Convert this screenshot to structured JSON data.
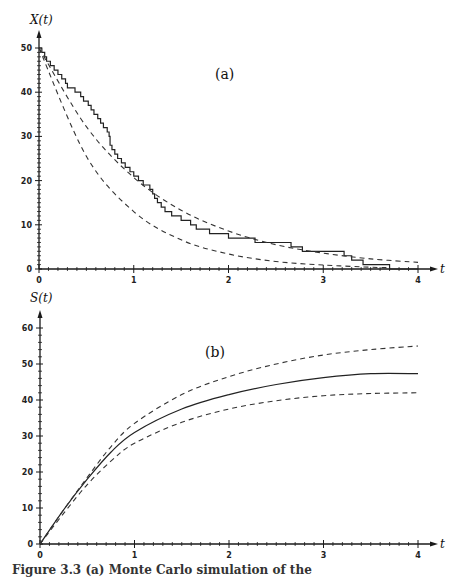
{
  "chart_data": [
    {
      "type": "line",
      "panel_label": "(a)",
      "ylabel": "X(t)",
      "xlabel": "t",
      "xlim": [
        0,
        4
      ],
      "ylim": [
        0,
        50
      ],
      "xticks": [
        "0",
        "1",
        "2",
        "3",
        "4"
      ],
      "yticks": [
        "0",
        "10",
        "20",
        "30",
        "40",
        "50"
      ],
      "grid": false,
      "series": [
        {
          "name": "simulated path (step)",
          "style": "solid-step",
          "points": [
            [
              0,
              50
            ],
            [
              0.03,
              49
            ],
            [
              0.06,
              48
            ],
            [
              0.08,
              47
            ],
            [
              0.12,
              46
            ],
            [
              0.16,
              45
            ],
            [
              0.2,
              44
            ],
            [
              0.24,
              43
            ],
            [
              0.28,
              42
            ],
            [
              0.3,
              41
            ],
            [
              0.38,
              40
            ],
            [
              0.44,
              39
            ],
            [
              0.47,
              38
            ],
            [
              0.52,
              37
            ],
            [
              0.55,
              36
            ],
            [
              0.58,
              35
            ],
            [
              0.62,
              34
            ],
            [
              0.65,
              33
            ],
            [
              0.68,
              32
            ],
            [
              0.72,
              31
            ],
            [
              0.74,
              30
            ],
            [
              0.75,
              28
            ],
            [
              0.77,
              27
            ],
            [
              0.8,
              26
            ],
            [
              0.83,
              25
            ],
            [
              0.87,
              24
            ],
            [
              0.91,
              23
            ],
            [
              0.96,
              22
            ],
            [
              1.0,
              21
            ],
            [
              1.05,
              20
            ],
            [
              1.1,
              19
            ],
            [
              1.17,
              18
            ],
            [
              1.2,
              17
            ],
            [
              1.22,
              16
            ],
            [
              1.25,
              15
            ],
            [
              1.29,
              14
            ],
            [
              1.33,
              13
            ],
            [
              1.4,
              12
            ],
            [
              1.5,
              11
            ],
            [
              1.6,
              10
            ],
            [
              1.66,
              9
            ],
            [
              1.8,
              8
            ],
            [
              2.0,
              7
            ],
            [
              2.28,
              6
            ],
            [
              2.66,
              5
            ],
            [
              2.78,
              4
            ],
            [
              3.22,
              3
            ],
            [
              3.3,
              2
            ],
            [
              3.42,
              1
            ],
            [
              3.7,
              0
            ],
            [
              4.0,
              0
            ]
          ]
        },
        {
          "name": "upper bound",
          "style": "dashed",
          "points": [
            [
              0,
              50
            ],
            [
              0.5,
              32.2
            ],
            [
              1,
              20.7
            ],
            [
              1.5,
              13.3
            ],
            [
              2,
              8.6
            ],
            [
              2.5,
              5.5
            ],
            [
              3,
              3.6
            ],
            [
              3.5,
              2.3
            ],
            [
              4,
              1.5
            ]
          ]
        },
        {
          "name": "lower bound",
          "style": "dashed",
          "points": [
            [
              0,
              50
            ],
            [
              0.5,
              25.5
            ],
            [
              1,
              13.0
            ],
            [
              1.5,
              6.6
            ],
            [
              2,
              3.4
            ],
            [
              2.5,
              1.7
            ],
            [
              3,
              0.9
            ],
            [
              3.5,
              0.4
            ],
            [
              3.7,
              0.3
            ]
          ]
        }
      ]
    },
    {
      "type": "line",
      "panel_label": "(b)",
      "ylabel": "S(t)",
      "xlabel": "t",
      "xlim": [
        0,
        4
      ],
      "ylim": [
        0,
        60
      ],
      "xticks": [
        "0",
        "1",
        "2",
        "3",
        "4"
      ],
      "yticks": [
        "0",
        "10",
        "20",
        "30",
        "40",
        "50",
        "60"
      ],
      "grid": false,
      "series": [
        {
          "name": "mean S(t)",
          "style": "solid",
          "points": [
            [
              0,
              0
            ],
            [
              0.25,
              9.5
            ],
            [
              0.5,
              18
            ],
            [
              0.75,
              25.5
            ],
            [
              1,
              31
            ],
            [
              1.5,
              37.5
            ],
            [
              2,
              41.5
            ],
            [
              2.5,
              44.3
            ],
            [
              3,
              46.2
            ],
            [
              3.5,
              47.3
            ],
            [
              4,
              47.3
            ]
          ]
        },
        {
          "name": "upper bound",
          "style": "dashed",
          "points": [
            [
              0,
              0
            ],
            [
              0.25,
              9.5
            ],
            [
              0.5,
              18.5
            ],
            [
              0.75,
              27
            ],
            [
              1,
              33.5
            ],
            [
              1.5,
              41.5
            ],
            [
              2,
              46.5
            ],
            [
              2.5,
              50
            ],
            [
              3,
              52.5
            ],
            [
              3.5,
              54
            ],
            [
              4,
              55
            ]
          ]
        },
        {
          "name": "lower bound",
          "style": "dashed",
          "points": [
            [
              0,
              0
            ],
            [
              0.25,
              8.5
            ],
            [
              0.5,
              16.5
            ],
            [
              0.75,
              23
            ],
            [
              1,
              28
            ],
            [
              1.5,
              33.8
            ],
            [
              2,
              37.5
            ],
            [
              2.5,
              39.8
            ],
            [
              3,
              41.2
            ],
            [
              3.5,
              41.8
            ],
            [
              4,
              42
            ]
          ]
        }
      ]
    }
  ],
  "caption": "Figure 3.3 (a) Monte Carlo simulation of the"
}
